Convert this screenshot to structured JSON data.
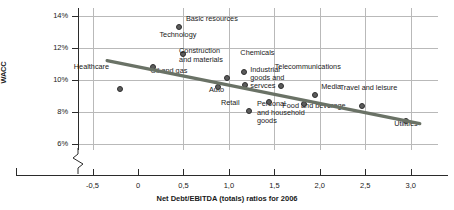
{
  "chart_data": {
    "type": "scatter",
    "title": "",
    "xlabel": "Net Debt/EBITDA (totals) ratios for 2006",
    "ylabel": "WACC",
    "xlim": [
      -0.66,
      3.3
    ],
    "ylim": [
      5.6,
      14.5
    ],
    "grid": true,
    "legend": "none",
    "xticks": [
      -0.5,
      0,
      0.5,
      1.0,
      1.5,
      2.0,
      2.5,
      3.0
    ],
    "xticklabels": [
      "-0,5",
      "0",
      "0,5",
      "1,0",
      "1,5",
      "2,0",
      "2,5",
      "3,0"
    ],
    "yticks": [
      6,
      8,
      10,
      12,
      14
    ],
    "yticklabels": [
      "6%",
      "8%",
      "10%",
      "12%",
      "14%"
    ],
    "axis_break_y": true,
    "points": [
      {
        "label": "Healthcare",
        "x": -0.2,
        "y": 9.45,
        "lx": -46,
        "ly": -18,
        "align": "left"
      },
      {
        "label": "Oil and gas",
        "x": 0.17,
        "y": 10.8,
        "lx": -3,
        "ly": 8,
        "align": "left"
      },
      {
        "label": "Basic resources",
        "x": 0.45,
        "y": 13.3,
        "lx": 7,
        "ly": -4,
        "align": "left"
      },
      {
        "label": "Technology",
        "x": 0.5,
        "y": 11.6,
        "lx": -24,
        "ly": -15,
        "align": "left"
      },
      {
        "label": "Auto",
        "x": 0.88,
        "y": 9.55,
        "lx": -9,
        "ly": 7,
        "align": "left"
      },
      {
        "label": "Construction\nand materials",
        "x": 0.98,
        "y": 10.1,
        "lx": -48,
        "ly": -23,
        "align": "left"
      },
      {
        "label": "Chemicals",
        "x": 1.17,
        "y": 10.5,
        "lx": -4,
        "ly": -15,
        "align": "left"
      },
      {
        "label": "Industrial\ngoods and\nservces",
        "x": 1.18,
        "y": 9.7,
        "lx": 5,
        "ly": -11,
        "align": "left"
      },
      {
        "label": "Retail",
        "x": 1.22,
        "y": 8.05,
        "lx": -28,
        "ly": -4,
        "align": "left"
      },
      {
        "label": "Personal\nand household\ngoods",
        "x": 1.44,
        "y": 8.6,
        "lx": -12,
        "ly": 6,
        "align": "left"
      },
      {
        "label": "Telecommunications",
        "x": 1.57,
        "y": 9.6,
        "lx": -6,
        "ly": -15,
        "align": "left"
      },
      {
        "label": "Food and beverage",
        "x": 1.83,
        "y": 8.5,
        "lx": -22,
        "ly": 6,
        "align": "left"
      },
      {
        "label": "Media",
        "x": 1.95,
        "y": 9.05,
        "lx": 6,
        "ly": -4,
        "align": "left"
      },
      {
        "label": "Travel and leisure",
        "x": 2.46,
        "y": 8.35,
        "lx": -22,
        "ly": -14,
        "align": "left"
      },
      {
        "label": "Utilities",
        "x": 2.95,
        "y": 7.4,
        "lx": -12,
        "ly": 7,
        "align": "left"
      }
    ],
    "trendline": {
      "x_start": -0.34,
      "y_start": 11.2,
      "x_end": 3.1,
      "y_end": 7.25,
      "color": "#6a7266"
    },
    "colors": {
      "marker_fill": "#5c5c5c",
      "marker_edge": "#2e2e2e",
      "grid": "#b9b9b9",
      "axis": "#2b2b2b",
      "trend": "#6a7266"
    }
  }
}
